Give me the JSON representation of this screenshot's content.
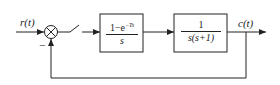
{
  "diagram": {
    "input_label": "r(t)",
    "output_label": "c(t)",
    "feedback_sign": "−",
    "blocks": [
      {
        "id": "zoh",
        "numerator": "1−e",
        "exponent": "−Ts",
        "denominator": "s"
      },
      {
        "id": "plant",
        "numerator": "1",
        "denominator": "s(s+1)"
      }
    ],
    "elements": [
      "summing-junction",
      "sampler-switch",
      "zero-order-hold",
      "plant",
      "unity-feedback"
    ],
    "line_color": "#222222"
  }
}
